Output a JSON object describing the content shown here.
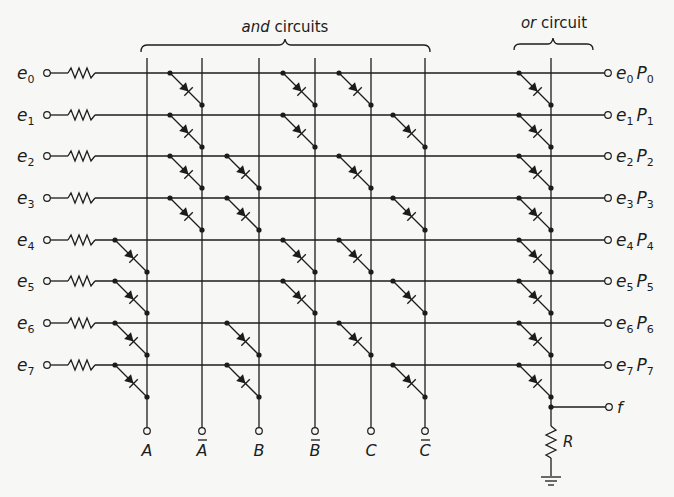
{
  "title": {
    "and_label_italic": "and",
    "and_label_rest": " circuits",
    "or_label_italic": "or",
    "or_label_rest": " circuit"
  },
  "inputs": [
    {
      "base": "e",
      "sub": "0"
    },
    {
      "base": "e",
      "sub": "1"
    },
    {
      "base": "e",
      "sub": "2"
    },
    {
      "base": "e",
      "sub": "3"
    },
    {
      "base": "e",
      "sub": "4"
    },
    {
      "base": "e",
      "sub": "5"
    },
    {
      "base": "e",
      "sub": "6"
    },
    {
      "base": "e",
      "sub": "7"
    }
  ],
  "outputs": [
    {
      "e_sub": "0",
      "p_sub": "0"
    },
    {
      "e_sub": "1",
      "p_sub": "1"
    },
    {
      "e_sub": "2",
      "p_sub": "2"
    },
    {
      "e_sub": "3",
      "p_sub": "3"
    },
    {
      "e_sub": "4",
      "p_sub": "4"
    },
    {
      "e_sub": "5",
      "p_sub": "5"
    },
    {
      "e_sub": "6",
      "p_sub": "6"
    },
    {
      "e_sub": "7",
      "p_sub": "7"
    }
  ],
  "columns": [
    {
      "label": "A",
      "bar": false
    },
    {
      "label": "A",
      "bar": true
    },
    {
      "label": "B",
      "bar": false
    },
    {
      "label": "B",
      "bar": true
    },
    {
      "label": "C",
      "bar": false
    },
    {
      "label": "C",
      "bar": true
    }
  ],
  "and_diodes": [
    [
      1,
      3,
      4
    ],
    [
      1,
      3,
      5
    ],
    [
      1,
      2,
      4
    ],
    [
      1,
      2,
      5
    ],
    [
      0,
      3,
      4
    ],
    [
      0,
      3,
      5
    ],
    [
      0,
      2,
      4
    ],
    [
      0,
      2,
      5
    ]
  ],
  "output_f_label": "f",
  "resistor_label": "R",
  "layout": {
    "row_y": [
      73,
      115,
      156,
      198,
      240,
      281,
      323,
      365
    ],
    "col_x": [
      147,
      202,
      259,
      315,
      371,
      425
    ],
    "or_bus_x": 551
  }
}
